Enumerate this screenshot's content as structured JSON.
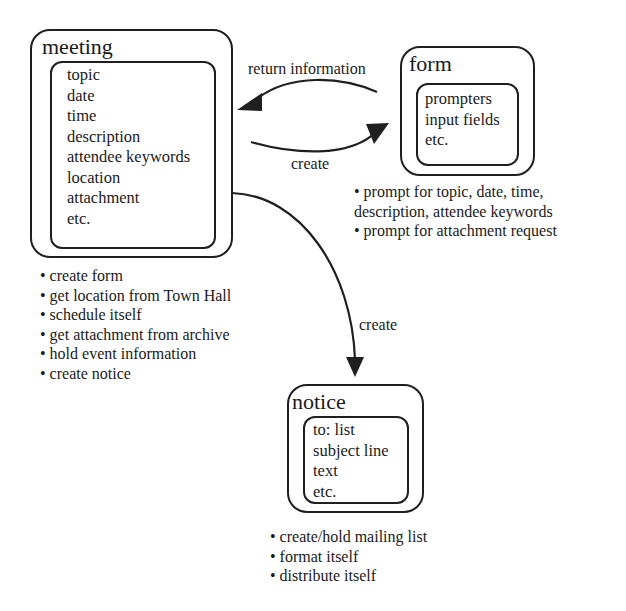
{
  "diagram": {
    "nodes": [
      {
        "id": "meeting",
        "title": "meeting",
        "attributes": [
          "topic",
          "date",
          "time",
          "description",
          "attendee keywords",
          "location",
          "attachment",
          "etc."
        ],
        "responsibilities": [
          "• create form",
          "• get location from Town Hall",
          "• schedule itself",
          "• get attachment from archive",
          "• hold event information",
          "• create notice"
        ]
      },
      {
        "id": "form",
        "title": "form",
        "attributes": [
          "prompters",
          "input fields",
          "etc."
        ],
        "responsibilities": [
          "• prompt for topic, date, time,",
          "description, attendee keywords",
          "• prompt for attachment request"
        ]
      },
      {
        "id": "notice",
        "title": "notice",
        "attributes": [
          "to: list",
          "subject line",
          "text",
          "etc."
        ],
        "responsibilities": [
          "• create/hold mailing list",
          "• format itself",
          "• distribute itself"
        ]
      }
    ],
    "edges": [
      {
        "from": "form",
        "to": "meeting",
        "label": "return information"
      },
      {
        "from": "meeting",
        "to": "form",
        "label": "create"
      },
      {
        "from": "meeting",
        "to": "notice",
        "label": "create"
      }
    ]
  },
  "colors": {
    "stroke": "#1f1f1f",
    "background": "#ffffff"
  }
}
